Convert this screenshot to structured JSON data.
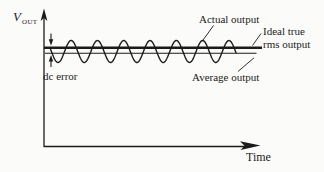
{
  "figure": {
    "background_color": "#fbfbf9",
    "ink_color": "#1b1b1b"
  },
  "axes": {
    "y_symbol": "V",
    "y_subscript": "OUT",
    "x_label": "Time"
  },
  "labels": {
    "actual_output": "Actual output",
    "ideal_true_line1": "Ideal true",
    "ideal_true_line2": "rms output",
    "average_output": "Average output",
    "dc_error": "dc error"
  },
  "curves": [
    {
      "name": "Actual output",
      "style": "sinusoidal ripple about the dc level"
    },
    {
      "name": "Ideal true rms output",
      "style": "thick horizontal line"
    },
    {
      "name": "Average output",
      "style": "thin horizontal line slightly below ideal"
    }
  ]
}
